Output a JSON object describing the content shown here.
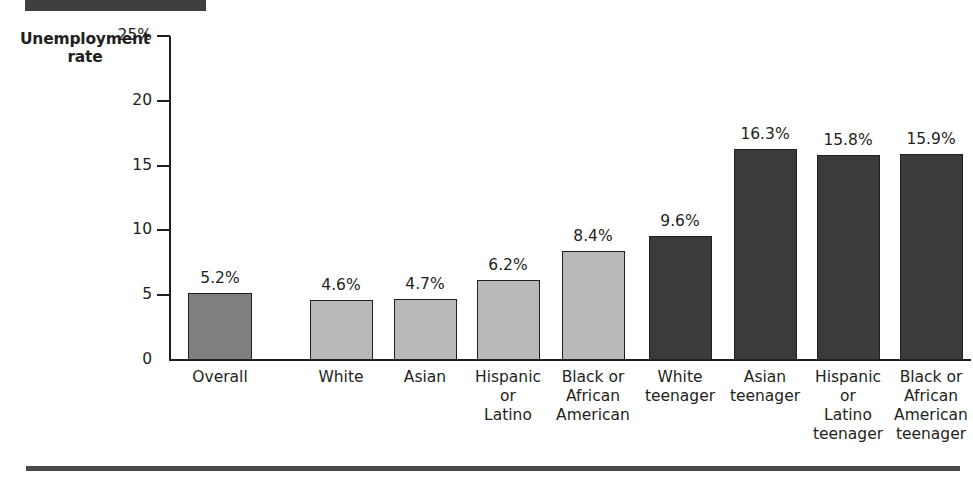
{
  "banner": {
    "name": "section-rule-top"
  },
  "axis_title": "Unemployment\nrate",
  "axis_title_line1": "Unemployment",
  "axis_title_line2": "rate",
  "colors": {
    "bar_overall": "#7f7f7f",
    "bar_adult": "#b9b9b9",
    "bar_teen": "#3b3b3b",
    "axis": "#231f20",
    "banner": "#3f3f3f",
    "rule": "#4a4a4a",
    "background": "#ffffff"
  },
  "chart_data": {
    "type": "bar",
    "title": "",
    "xlabel": "",
    "ylabel": "Unemployment rate",
    "ylim": [
      0,
      27
    ],
    "yticks": [
      0,
      5,
      10,
      15,
      20,
      25
    ],
    "ytick_labels": [
      "0",
      "5",
      "10",
      "15",
      "20",
      "25%"
    ],
    "grid": false,
    "legend": "none",
    "groups": [
      {
        "name": "all-workers",
        "categories": [
          "Overall",
          "White",
          "Asian",
          "Hispanic or Latino",
          "Black or African American"
        ],
        "values": [
          5.2,
          4.6,
          4.7,
          6.2,
          8.4
        ],
        "value_labels": [
          "5.2%",
          "4.6%",
          "4.7%",
          "6.2%",
          "8.4%"
        ]
      },
      {
        "name": "teenagers",
        "categories": [
          "White teenager",
          "Asian teenager",
          "Hispanic or Latino teenager",
          "Black or African American teenager"
        ],
        "values": [
          9.6,
          16.3,
          15.8,
          15.9
        ],
        "value_labels": [
          "9.6%",
          "16.3%",
          "15.8%",
          "15.9%"
        ]
      }
    ],
    "categories": [
      "Overall",
      "White",
      "Asian",
      "Hispanic or Latino",
      "Black or African American",
      "White teenager",
      "Asian teenager",
      "Hispanic or Latino teenager",
      "Black or African American teenager"
    ],
    "values": [
      5.2,
      4.6,
      4.7,
      6.2,
      8.4,
      9.6,
      16.3,
      15.8,
      15.9
    ]
  },
  "bars": [
    {
      "key": "overall",
      "value_label": "5.2%",
      "lines": [
        "Overall"
      ],
      "shade": "overall"
    },
    {
      "key": "white",
      "value_label": "4.6%",
      "lines": [
        "White"
      ],
      "shade": "adult"
    },
    {
      "key": "asian",
      "value_label": "4.7%",
      "lines": [
        "Asian"
      ],
      "shade": "adult"
    },
    {
      "key": "hispanic",
      "value_label": "6.2%",
      "lines": [
        "Hispanic",
        "or",
        "Latino"
      ],
      "shade": "adult"
    },
    {
      "key": "black",
      "value_label": "8.4%",
      "lines": [
        "Black or",
        "African",
        "American"
      ],
      "shade": "adult"
    },
    {
      "key": "white-teen",
      "value_label": "9.6%",
      "lines": [
        "White",
        "teenager"
      ],
      "shade": "teen"
    },
    {
      "key": "asian-teen",
      "value_label": "16.3%",
      "lines": [
        "Asian",
        "teenager"
      ],
      "shade": "teen"
    },
    {
      "key": "hispanic-teen",
      "value_label": "15.8%",
      "lines": [
        "Hispanic",
        "or",
        "Latino",
        "teenager"
      ],
      "shade": "teen"
    },
    {
      "key": "black-teen",
      "value_label": "15.9%",
      "lines": [
        "Black or",
        "African",
        "American",
        "teenager"
      ],
      "shade": "teen"
    }
  ],
  "ticks": [
    {
      "label": "25%",
      "value": 25
    },
    {
      "label": "20",
      "value": 20
    },
    {
      "label": "15",
      "value": 15
    },
    {
      "label": "10",
      "value": 10
    },
    {
      "label": "5",
      "value": 5
    },
    {
      "label": "0",
      "value": 0
    }
  ]
}
